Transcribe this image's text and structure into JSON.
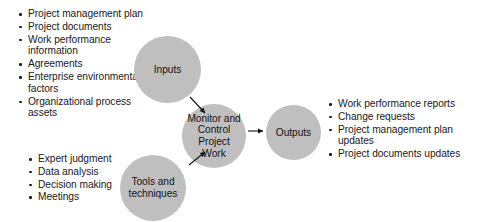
{
  "diagram": {
    "type": "process-flow",
    "colors": {
      "circle_fill": "#bfbfbf",
      "text": "#1a1a1a",
      "arrow": "#111111",
      "background": "#ffffff"
    },
    "nodes": {
      "inputs": {
        "label": "Inputs"
      },
      "tools": {
        "label": "Tools and techniques"
      },
      "process": {
        "label": "Monitor and Control Project Work"
      },
      "outputs": {
        "label": "Outputs"
      }
    },
    "inputs_list": [
      "Project management plan",
      "Project documents",
      "Work performance information",
      "Agreements",
      "Enterprise environmental factors",
      "Organizational process assets"
    ],
    "tools_list": [
      "Expert judgment",
      "Data analysis",
      "Decision making",
      "Meetings"
    ],
    "outputs_list": [
      "Work performance reports",
      "Change requests",
      "Project management plan updates",
      "Project documents updates"
    ],
    "arrows": [
      {
        "name": "inputs-to-process",
        "from": "inputs",
        "to": "process"
      },
      {
        "name": "tools-to-process",
        "from": "tools",
        "to": "process"
      },
      {
        "name": "process-to-outputs",
        "from": "process",
        "to": "outputs"
      }
    ]
  }
}
